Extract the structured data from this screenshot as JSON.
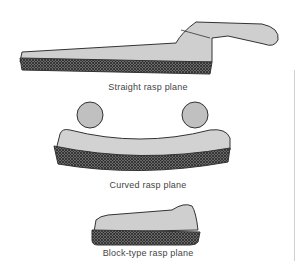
{
  "figure": {
    "items": [
      {
        "label": "Straight rasp plane",
        "icon": "straight-rasp-plane"
      },
      {
        "label": "Curved rasp plane",
        "icon": "curved-rasp-plane"
      },
      {
        "label": "Block-type rasp plane",
        "icon": "block-rasp-plane"
      }
    ],
    "colors": {
      "body": "#c8c8c8",
      "outline": "#333333",
      "rasp": "#5a5a5a"
    }
  }
}
